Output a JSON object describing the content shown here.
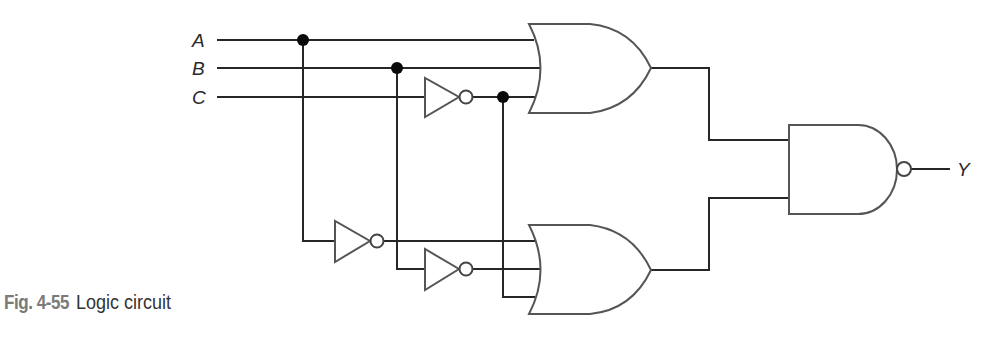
{
  "figure": {
    "number": "Fig. 4-55",
    "title": "Logic circuit"
  },
  "inputs": [
    {
      "name": "A",
      "y": 40
    },
    {
      "name": "B",
      "y": 68
    },
    {
      "name": "C",
      "y": 97
    }
  ],
  "output": {
    "name": "Y"
  },
  "gates": [
    {
      "id": "inv-c",
      "type": "NOT",
      "input": "C"
    },
    {
      "id": "inv-a",
      "type": "NOT",
      "input": "A"
    },
    {
      "id": "inv-b",
      "type": "NOT",
      "input": "B"
    },
    {
      "id": "or-top",
      "type": "OR",
      "inputs": [
        "A",
        "B",
        "C'"
      ]
    },
    {
      "id": "or-bottom",
      "type": "OR",
      "inputs": [
        "A'",
        "B'",
        "C'"
      ]
    },
    {
      "id": "nand-out",
      "type": "NAND",
      "inputs": [
        "or-top",
        "or-bottom"
      ],
      "output": "Y"
    }
  ],
  "colors": {
    "wire": "#262626",
    "gate_outline": "#555555",
    "junction": "#0a0a0a",
    "caption_number": "#7a7a7a",
    "caption_title": "#333333"
  }
}
